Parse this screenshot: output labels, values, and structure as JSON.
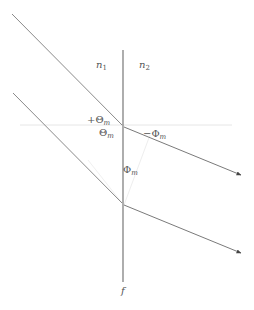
{
  "diagram": {
    "colors": {
      "line": "#6b6b6b",
      "normal": "#e4e4e4",
      "text": "#555555",
      "background": "#ffffff"
    },
    "labels": {
      "n1": {
        "base": "n",
        "sub": "1"
      },
      "n2": {
        "base": "n",
        "sub": "2"
      },
      "plus_theta_m": {
        "base": "+Θ",
        "sub": "m"
      },
      "theta_m": {
        "base": "Θ",
        "sub": "m"
      },
      "minus_phi_m": {
        "base": "−Φ",
        "sub": "m"
      },
      "phi_m": {
        "base": "Φ",
        "sub": "m"
      },
      "f": "f"
    },
    "elements": {
      "interface_line": {
        "x": 123,
        "y1": 50,
        "y2": 282
      },
      "incident_rays": [
        {
          "from": [
            12,
            14
          ],
          "to": [
            122,
            125
          ]
        },
        {
          "from": [
            13,
            93
          ],
          "to": [
            122,
            203
          ]
        }
      ],
      "refracted_rays": [
        {
          "from": [
            124,
            127
          ],
          "to": [
            241,
            175
          ]
        },
        {
          "from": [
            124,
            205
          ],
          "to": [
            241,
            253
          ]
        }
      ],
      "normal_line": {
        "y": 125,
        "x1": 20,
        "x2": 232
      }
    }
  }
}
